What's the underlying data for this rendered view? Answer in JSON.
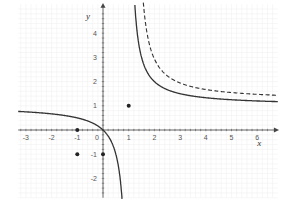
{
  "chart_data": {
    "type": "line",
    "title": "",
    "xlabel": "x",
    "ylabel": "y",
    "xlim": [
      -3.3,
      6.8
    ],
    "ylim": [
      -2.8,
      5.3
    ],
    "x_ticks": [
      -3,
      -2,
      -1,
      0,
      1,
      2,
      3,
      4,
      5,
      6
    ],
    "y_ticks": [
      -2,
      -1,
      1,
      2,
      3,
      4
    ],
    "grid": true,
    "series": [
      {
        "name": "solid-hyperbola",
        "style": "solid",
        "equation": "y = x/(x-1)",
        "asymptotes": {
          "x": 1,
          "y": 1
        }
      },
      {
        "name": "dashed-hyperbola",
        "style": "dashed",
        "equation": "y = 1.2 + 1.3/(x-1.25)",
        "asymptotes": {
          "x": 1.25,
          "y": 1.2
        }
      }
    ],
    "points": [
      {
        "x": 1,
        "y": 1
      },
      {
        "x": -1,
        "y": 0
      },
      {
        "x": -1,
        "y": -1
      },
      {
        "x": 0,
        "y": -1
      }
    ]
  },
  "colors": {
    "curve": "#333333",
    "axis": "#444444",
    "grid": "#eeeeee",
    "point": "#222222"
  }
}
